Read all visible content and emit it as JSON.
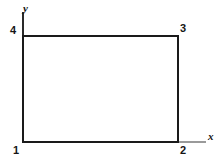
{
  "figure": {
    "kind": "geometry-diagram",
    "background_color": "#ffffff",
    "shape_color": "#1a1a1a",
    "axis_color": "#9a9a9a"
  },
  "axes": {
    "x_label": "x",
    "y_label": "y",
    "x_axis": {
      "x1": 23,
      "y1": 142,
      "x2": 206,
      "y2": 142
    },
    "y_axis": {
      "x1": 23,
      "y1": 12,
      "x2": 23,
      "y2": 36
    }
  },
  "shape": {
    "name": "rectangle",
    "stroke_width": 2,
    "corners": {
      "top_left": {
        "x": 23,
        "y": 36
      },
      "top_right": {
        "x": 178,
        "y": 36
      },
      "bottom_right": {
        "x": 178,
        "y": 142
      },
      "bottom_left": {
        "x": 23,
        "y": 142
      }
    }
  },
  "vertices": [
    {
      "id": "1",
      "label": "1",
      "position": "bottom-left"
    },
    {
      "id": "2",
      "label": "2",
      "position": "bottom-right"
    },
    {
      "id": "3",
      "label": "3",
      "position": "top-right"
    },
    {
      "id": "4",
      "label": "4",
      "position": "top-left"
    }
  ]
}
